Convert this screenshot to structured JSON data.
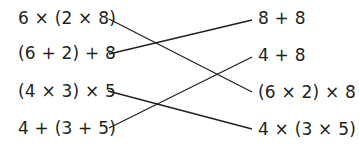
{
  "left_expressions": [
    "6 × (2 × 8)",
    "(6 + 2) + 8",
    "(4 × 3) × 5",
    "4 + (3 + 5)"
  ],
  "right_expressions": [
    "8 + 8",
    "4 + 8",
    "(6 × 2) × 8",
    "4 × (3 × 5)"
  ],
  "connections": [
    {
      "left": "6 × (2 × 8)",
      "right": "(6 × 2) × 8"
    },
    {
      "left": "(6 + 2) + 8",
      "right": "8 + 8"
    },
    {
      "left": "(4 × 3) × 5",
      "right": "4 × (3 × 5)"
    },
    {
      "left": "4 + (3 + 5)",
      "right": "4 + 8"
    }
  ],
  "colors": {
    "text": "#231f20",
    "line": "#231f20"
  }
}
